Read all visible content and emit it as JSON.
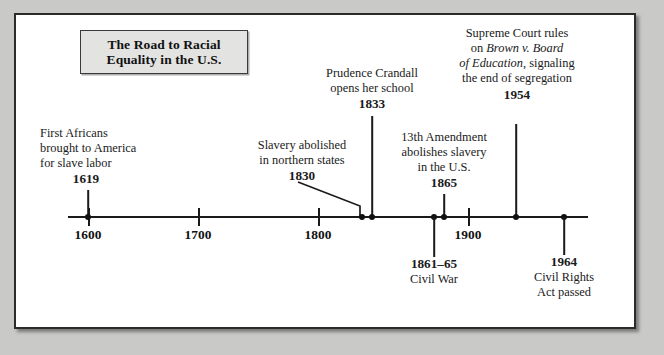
{
  "title": {
    "line1": "The Road to Racial",
    "line2": "Equality in the U.S."
  },
  "axis": {
    "ticks": [
      {
        "label": "1600",
        "x": 88
      },
      {
        "label": "1700",
        "x": 198
      },
      {
        "label": "1800",
        "x": 318
      },
      {
        "label": "1900",
        "x": 468
      }
    ]
  },
  "events": [
    {
      "name": "first-africans",
      "year": "1619",
      "lines": [
        "First Africans",
        "brought to America",
        "for slave labor"
      ],
      "x": 88,
      "side": "above"
    },
    {
      "name": "slavery-abolished-north",
      "year": "1830",
      "lines": [
        "Slavery abolished",
        "in northern states"
      ],
      "x": 362,
      "side": "above"
    },
    {
      "name": "prudence-crandall",
      "year": "1833",
      "lines": [
        "Prudence Crandall",
        "opens her school"
      ],
      "x": 372,
      "side": "above"
    },
    {
      "name": "thirteenth-amendment",
      "year": "1865",
      "lines": [
        "13th Amendment",
        "abolishes slavery",
        "in the U.S."
      ],
      "x": 444,
      "side": "above"
    },
    {
      "name": "brown-v-board",
      "year": "1954",
      "lines_pre": [
        "Supreme Court rules",
        "on "
      ],
      "italic": "Brown v. Board",
      "italic2": "of Education",
      "lines_post": [
        ", signaling",
        "the end of segregation"
      ],
      "x": 516,
      "side": "above"
    },
    {
      "name": "civil-war",
      "year": "1861–65",
      "lines": [
        "Civil War"
      ],
      "x": 434,
      "side": "below"
    },
    {
      "name": "civil-rights-act",
      "year": "1964",
      "lines": [
        "Civil Rights",
        "Act passed"
      ],
      "x": 564,
      "side": "below"
    }
  ],
  "brown": {
    "l1": "Supreme Court rules",
    "l2a": "on ",
    "l2b": "Brown v. Board",
    "l3a": "of Education",
    "l3b": ", signaling",
    "l4": "the end of segregation",
    "year": "1954"
  },
  "first_africans": {
    "l1": "First Africans",
    "l2": "brought to America",
    "l3": "for slave labor",
    "year": "1619"
  },
  "slavery_north": {
    "l1": "Slavery abolished",
    "l2": "in northern states",
    "year": "1830"
  },
  "crandall": {
    "l1": "Prudence Crandall",
    "l2": "opens her school",
    "year": "1833"
  },
  "amendment": {
    "l1": "13th Amendment",
    "l2": "abolishes slavery",
    "l3": "in the U.S.",
    "year": "1865"
  },
  "civil_war": {
    "year": "1861–65",
    "l1": "Civil War"
  },
  "civil_rights": {
    "year": "1964",
    "l1": "Civil Rights",
    "l2": "Act passed"
  },
  "ticks": {
    "t1600": "1600",
    "t1700": "1700",
    "t1800": "1800",
    "t1900": "1900"
  }
}
